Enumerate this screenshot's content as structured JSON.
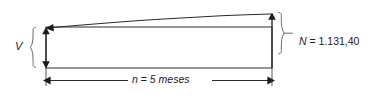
{
  "diagram": {
    "stroke_color": "#2b2b2b",
    "text_color": "#1b1b1b",
    "background_color": "#ffffff",
    "present_value": {
      "symbol": "V",
      "icon": "left-curly-brace"
    },
    "future_value": {
      "symbol": "N",
      "equals": "=",
      "value": "1.131,40",
      "full_label": "N = 1.131,40",
      "icon": "right-curly-brace"
    },
    "period": {
      "symbol": "n",
      "equals": "=",
      "count": "5",
      "unit": "meses",
      "full_label": "n = 5 meses"
    },
    "arrows": {
      "growth_curve": "curved-arrow-icon",
      "up_arrow": "arrow-up-icon",
      "down_arrow": "arrow-down-icon",
      "dimension_arrow": "double-headed-arrow-icon"
    }
  }
}
